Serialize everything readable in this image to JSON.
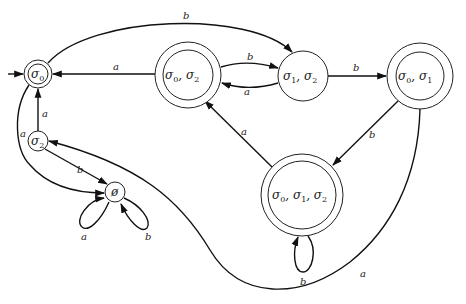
{
  "diagram": {
    "type": "deterministic finite automaton (subset construction)",
    "states": [
      {
        "id": "s0",
        "label": "σ0",
        "accepting": true,
        "initial": true
      },
      {
        "id": "s02",
        "label": "σ0, σ2",
        "accepting": true
      },
      {
        "id": "s12",
        "label": "σ1, σ2",
        "accepting": false
      },
      {
        "id": "s01",
        "label": "σ0, σ1",
        "accepting": true
      },
      {
        "id": "s012",
        "label": "σ0, σ1, σ2",
        "accepting": true
      },
      {
        "id": "s2",
        "label": "σ2",
        "accepting": false
      },
      {
        "id": "empty",
        "label": "∅",
        "accepting": false
      }
    ],
    "transitions": [
      {
        "from": "s0",
        "to": "s12",
        "symbol": "b"
      },
      {
        "from": "s0",
        "to": "empty",
        "symbol": "a"
      },
      {
        "from": "s02",
        "to": "s0",
        "symbol": "a"
      },
      {
        "from": "s02",
        "to": "s12",
        "symbol": "b"
      },
      {
        "from": "s12",
        "to": "s02",
        "symbol": "a"
      },
      {
        "from": "s12",
        "to": "s01",
        "symbol": "b"
      },
      {
        "from": "s01",
        "to": "s012",
        "symbol": "b"
      },
      {
        "from": "s01",
        "to": "s2",
        "symbol": "a"
      },
      {
        "from": "s012",
        "to": "s02",
        "symbol": "a"
      },
      {
        "from": "s012",
        "to": "s012",
        "symbol": "b"
      },
      {
        "from": "s2",
        "to": "s0",
        "symbol": "a"
      },
      {
        "from": "s2",
        "to": "empty",
        "symbol": "b"
      },
      {
        "from": "empty",
        "to": "empty",
        "symbol": "a"
      },
      {
        "from": "empty",
        "to": "empty",
        "symbol": "b"
      }
    ]
  },
  "labels": {
    "s0_base": "σ",
    "s0_sub": "0",
    "s2_base": "σ",
    "s2_sub": "2",
    "empty": "ø",
    "sym_a": "a",
    "sym_b": "b"
  }
}
